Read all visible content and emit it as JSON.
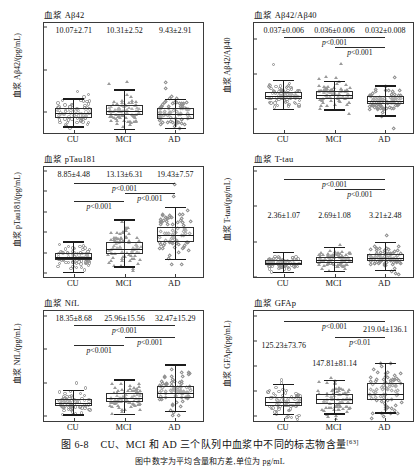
{
  "figure": {
    "caption_label": "图 6-8",
    "caption_text": "CU、MCI 和 AD 三个队列中血浆中不同的标志物含量",
    "caption_ref": "[63]",
    "caption_sub": "图中数字为平均含量和方差,单位为 pg/mL",
    "groups": [
      "CU",
      "MCI",
      "AD"
    ]
  },
  "chart_data": [
    {
      "id": "abeta42",
      "type": "box",
      "title": "血浆 Aβ42",
      "ylabel": "血浆 Aβ42/(pg/mL)",
      "xlabel": "",
      "categories": [
        "CU",
        "MCI",
        "AD"
      ],
      "ylim": [
        5,
        31
      ],
      "yticks": [
        10,
        20,
        30
      ],
      "ytick_labels": [
        "10",
        "20",
        "30"
      ],
      "grid": false,
      "stats_labels": [
        "10.07±2.71",
        "10.31±2.52",
        "9.43±2.91"
      ],
      "means": [
        10.07,
        10.31,
        9.43
      ],
      "sds": [
        2.71,
        2.52,
        2.91
      ],
      "boxes": [
        {
          "group": "CU",
          "q1": 8.6,
          "median": 9.8,
          "q3": 11.0,
          "whisker_low": 6.6,
          "whisker_high": 13.2,
          "marker": "circle"
        },
        {
          "group": "MCI",
          "q1": 9.2,
          "median": 10.2,
          "q3": 11.6,
          "whisker_low": 6.0,
          "whisker_high": 15.3,
          "marker": "tri"
        },
        {
          "group": "AD",
          "q1": 8.3,
          "median": 9.5,
          "q3": 10.8,
          "whisker_low": 6.3,
          "whisker_high": 13.0,
          "marker": "diam"
        }
      ],
      "pvalues": []
    },
    {
      "id": "abeta_ratio",
      "type": "box",
      "title": "血浆 Aβ42/Aβ40",
      "ylabel": "血浆 Aβ42/Aβ40",
      "xlabel": "",
      "categories": [
        "CU",
        "MCI",
        "AD"
      ],
      "ylim": [
        0.008,
        0.086
      ],
      "yticks": [
        0.025,
        0.05,
        0.075
      ],
      "ytick_labels": [
        "0.025",
        "0.050",
        "0.075"
      ],
      "grid": false,
      "stats_labels": [
        "0.037±0.006",
        "0.036±0.006",
        "0.032±0.008"
      ],
      "means": [
        0.037,
        0.036,
        0.032
      ],
      "sds": [
        0.006,
        0.006,
        0.008
      ],
      "boxes": [
        {
          "group": "CU",
          "q1": 0.032,
          "median": 0.0345,
          "q3": 0.0372,
          "whisker_low": 0.025,
          "whisker_high": 0.0455,
          "marker": "circle"
        },
        {
          "group": "MCI",
          "q1": 0.0322,
          "median": 0.035,
          "q3": 0.0378,
          "whisker_low": 0.0248,
          "whisker_high": 0.0448,
          "marker": "tri"
        },
        {
          "group": "AD",
          "q1": 0.0288,
          "median": 0.031,
          "q3": 0.034,
          "whisker_low": 0.0205,
          "whisker_high": 0.0418,
          "marker": "diam"
        }
      ],
      "pvalues": [
        {
          "from": "CU",
          "to": "AD",
          "label": "p<0.001"
        },
        {
          "from": "MCI",
          "to": "AD",
          "label": "p<0.001"
        }
      ]
    },
    {
      "id": "ptau181",
      "type": "box",
      "title": "血浆 pTau181",
      "ylabel": "血浆 pTau181/(pg/mL)",
      "xlabel": "",
      "categories": [
        "CU",
        "MCI",
        "AD"
      ],
      "ylim": [
        -2,
        52
      ],
      "yticks": [
        0,
        10,
        20,
        30,
        40,
        50
      ],
      "ytick_labels": [
        "0",
        "10",
        "20",
        "30",
        "40",
        "50"
      ],
      "grid": false,
      "stats_labels": [
        "8.85±4.48",
        "13.13±6.31",
        "19.43±7.57"
      ],
      "means": [
        8.85,
        13.13,
        19.43
      ],
      "sds": [
        4.48,
        6.31,
        7.57
      ],
      "boxes": [
        {
          "group": "CU",
          "q1": 6.1,
          "median": 7.7,
          "q3": 9.6,
          "whisker_low": 0.6,
          "whisker_high": 15.5,
          "marker": "circle"
        },
        {
          "group": "MCI",
          "q1": 9.3,
          "median": 11.7,
          "q3": 15.4,
          "whisker_low": 3.2,
          "whisker_high": 26.3,
          "marker": "tri"
        },
        {
          "group": "AD",
          "q1": 15.3,
          "median": 18.6,
          "q3": 22.6,
          "whisker_low": 7.0,
          "whisker_high": 32.5,
          "marker": "diam"
        }
      ],
      "pvalues": [
        {
          "from": "CU",
          "to": "AD",
          "label": "p<0.001"
        },
        {
          "from": "MCI",
          "to": "AD",
          "label": "p<0.001"
        },
        {
          "from": "CU",
          "to": "MCI",
          "label": "p<0.001"
        }
      ]
    },
    {
      "id": "ttau",
      "type": "box",
      "title": "血浆 T-tau",
      "ylabel": "血浆 T-tau/(pg/mL)",
      "xlabel": "",
      "categories": [
        "CU",
        "MCI",
        "AD"
      ],
      "ylim": [
        0,
        15.6
      ],
      "yticks": [
        0,
        5,
        10,
        15
      ],
      "ytick_labels": [
        "0",
        "5",
        "10",
        "15"
      ],
      "grid": false,
      "stats_labels": [
        "2.36±1.07",
        "2.69±1.08",
        "3.21±2.48"
      ],
      "means": [
        2.36,
        2.69,
        3.21
      ],
      "sds": [
        1.07,
        1.08,
        2.48
      ],
      "boxes": [
        {
          "group": "CU",
          "q1": 1.7,
          "median": 1.98,
          "q3": 2.35,
          "whisker_low": 0.7,
          "whisker_high": 3.55,
          "marker": "circle"
        },
        {
          "group": "MCI",
          "q1": 2.0,
          "median": 2.4,
          "q3": 2.8,
          "whisker_low": 0.9,
          "whisker_high": 4.25,
          "marker": "tri"
        },
        {
          "group": "AD",
          "q1": 2.3,
          "median": 2.7,
          "q3": 3.2,
          "whisker_low": 1.0,
          "whisker_high": 4.95,
          "marker": "diam"
        }
      ],
      "pvalues": [
        {
          "from": "CU",
          "to": "AD",
          "label": "p<0.001"
        },
        {
          "from": "MCI",
          "to": "AD",
          "label": "p<0.001"
        }
      ]
    },
    {
      "id": "nfl",
      "type": "box",
      "title": "血浆 NfL",
      "ylabel": "血浆 NfL/(pg/mL)",
      "xlabel": "",
      "categories": [
        "CU",
        "MCI",
        "AD"
      ],
      "ylim": [
        -6,
        126
      ],
      "yticks": [
        0,
        40,
        80,
        120
      ],
      "ytick_labels": [
        "0",
        "40",
        "80",
        "120"
      ],
      "grid": false,
      "stats_labels": [
        "18.35±8.68",
        "25.96±15.56",
        "32.47±15.29"
      ],
      "means": [
        18.35,
        25.96,
        32.47
      ],
      "sds": [
        8.68,
        15.56,
        15.29
      ],
      "boxes": [
        {
          "group": "CU",
          "q1": 12.5,
          "median": 16.0,
          "q3": 20.0,
          "whisker_low": 2.0,
          "whisker_high": 31.0,
          "marker": "circle"
        },
        {
          "group": "MCI",
          "q1": 17.0,
          "median": 22.0,
          "q3": 28.0,
          "whisker_low": 3.0,
          "whisker_high": 44.0,
          "marker": "tri"
        },
        {
          "group": "AD",
          "q1": 22.0,
          "median": 28.0,
          "q3": 36.0,
          "whisker_low": 6.0,
          "whisker_high": 62.0,
          "marker": "diam"
        }
      ],
      "pvalues": [
        {
          "from": "CU",
          "to": "AD",
          "label": "p<0.001"
        },
        {
          "from": "MCI",
          "to": "AD",
          "label": "p<0.001"
        },
        {
          "from": "CU",
          "to": "MCI",
          "label": "p<0.001"
        }
      ]
    },
    {
      "id": "gfap",
      "type": "box",
      "title": "血浆 GFAp",
      "ylabel": "血浆 GFAp/(pg/mL)",
      "xlabel": "",
      "categories": [
        "CU",
        "MCI",
        "AD"
      ],
      "ylim": [
        -40,
        840
      ],
      "yticks": [
        0,
        200,
        400,
        600,
        800
      ],
      "ytick_labels": [
        "0",
        "200",
        "400",
        "600",
        "800"
      ],
      "grid": false,
      "stats_labels": [
        "125.23±73.76",
        "147.81±81.14",
        "219.04±136.1"
      ],
      "means": [
        125.23,
        147.81,
        219.04
      ],
      "sds": [
        73.76,
        81.14,
        136.1
      ],
      "boxes": [
        {
          "group": "CU",
          "q1": 78,
          "median": 113,
          "q3": 150,
          "whisker_low": 16,
          "whisker_high": 258,
          "marker": "circle"
        },
        {
          "group": "MCI",
          "q1": 100,
          "median": 137,
          "q3": 178,
          "whisker_low": 22,
          "whisker_high": 290,
          "marker": "tri"
        },
        {
          "group": "AD",
          "q1": 125,
          "median": 176,
          "q3": 262,
          "whisker_low": 30,
          "whisker_high": 425,
          "marker": "diam"
        }
      ],
      "pvalues": [
        {
          "from": "CU",
          "to": "AD",
          "label": "p<0.001"
        },
        {
          "from": "MCI",
          "to": "AD",
          "label": "p<0.01"
        }
      ]
    }
  ]
}
